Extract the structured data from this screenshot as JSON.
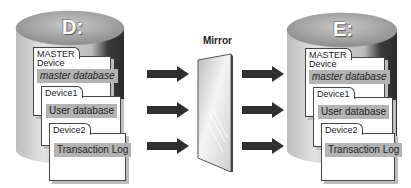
{
  "diagram": {
    "source_disk": {
      "label": "D:",
      "master_device": {
        "tab": "MASTER",
        "subtitle": "Device",
        "content": "master database"
      },
      "device1": {
        "tab": "Device1",
        "content": "User database"
      },
      "device2": {
        "tab": "Device2",
        "content": "Transaction Log"
      }
    },
    "mirror": {
      "label": "Mirror"
    },
    "target_disk": {
      "label": "E:",
      "master_device": {
        "tab": "MASTER",
        "subtitle": "Device",
        "content": "master database"
      },
      "device1": {
        "tab": "Device1",
        "content": "User database"
      },
      "device2": {
        "tab": "Device2",
        "content": "Transaction Log"
      }
    },
    "arrows": {
      "left_count": 3,
      "right_count": 3
    },
    "colors": {
      "cylinder_top": "#a9a9a9",
      "cylinder_body": "#cfcfcf",
      "cylinder_dark": "#3a3a3a",
      "arrow": "#2f2f2f",
      "label_fill": "#b3b3b3",
      "mirror_fill": "#e8e8e8"
    }
  }
}
